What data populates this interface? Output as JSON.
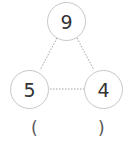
{
  "diagram": {
    "type": "number-bond-triangle",
    "nodes": {
      "top": "9",
      "left": "5",
      "right": "4"
    },
    "edges": [
      {
        "from": "top",
        "to": "left",
        "style": "dotted"
      },
      {
        "from": "top",
        "to": "right",
        "style": "dotted"
      },
      {
        "from": "left",
        "to": "right",
        "style": "dotted"
      }
    ],
    "answer_blank": {
      "open": "(",
      "close": ")"
    },
    "colors": {
      "circle_border": "#c8c8c8",
      "line": "#a0a0a0",
      "text": "#333333"
    }
  }
}
